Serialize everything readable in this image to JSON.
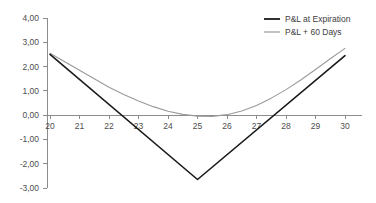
{
  "chart_data": {
    "type": "line",
    "title": "",
    "subtitle": "",
    "xlabel": "",
    "ylabel": "",
    "xlim": [
      20,
      30
    ],
    "ylim": [
      -3,
      4
    ],
    "grid": false,
    "legend_position": "top-right",
    "x_tick_labels": [
      "20",
      "21",
      "22",
      "23",
      "24",
      "25",
      "26",
      "27",
      "28",
      "29",
      "30"
    ],
    "x_ticks": [
      20,
      21,
      22,
      23,
      24,
      25,
      26,
      27,
      28,
      29,
      30
    ],
    "y_tick_labels": [
      "4,00",
      "3,00",
      "2,00",
      "1,00",
      "0,00",
      "-1,00",
      "-2,00",
      "-3,00"
    ],
    "y_ticks": [
      4,
      3,
      2,
      1,
      0,
      -1,
      -2,
      -3
    ],
    "series": [
      {
        "name": "P&L at Expiration",
        "color": "#1a1a1a",
        "width": 1.6,
        "x": [
          20,
          25,
          30
        ],
        "values": [
          2.5,
          -2.65,
          2.45
        ]
      },
      {
        "name": "P&L + 60 Days",
        "color": "#9a9a9a",
        "width": 1.1,
        "x": [
          20,
          20.5,
          21,
          21.5,
          22,
          22.5,
          23,
          23.5,
          24,
          24.5,
          25,
          25.5,
          26,
          26.5,
          27,
          27.5,
          28,
          28.5,
          29,
          29.5,
          30
        ],
        "values": [
          2.55,
          2.2,
          1.85,
          1.5,
          1.15,
          0.85,
          0.58,
          0.35,
          0.16,
          0.03,
          -0.04,
          -0.05,
          0.02,
          0.17,
          0.4,
          0.7,
          1.05,
          1.45,
          1.88,
          2.32,
          2.75
        ]
      }
    ]
  },
  "legend": {
    "entries": [
      {
        "label": "P&L at Expiration",
        "color": "#1a1a1a"
      },
      {
        "label": "P&L + 60 Days",
        "color": "#9a9a9a"
      }
    ]
  },
  "colors": {
    "background": "#ffffff",
    "axis": "#8c8c8c",
    "tick_text": "#4d4d4d",
    "expiration_line": "#1a1a1a",
    "sixty_days_line": "#9a9a9a"
  }
}
